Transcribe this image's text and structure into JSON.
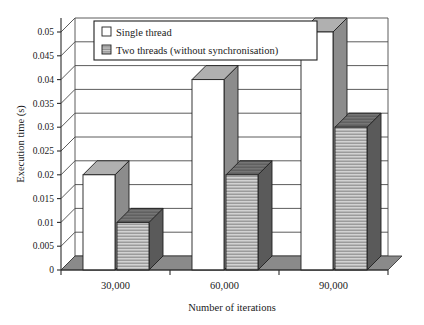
{
  "chart_data": {
    "type": "bar",
    "title": "",
    "xlabel": "Number of iterations",
    "ylabel": "Execution time (s)",
    "categories": [
      "30,000",
      "60,000",
      "90,000"
    ],
    "series": [
      {
        "name": "Single thread",
        "values": [
          0.02,
          0.04,
          0.05
        ]
      },
      {
        "name": "Two threads (without synchronisation)",
        "values": [
          0.01,
          0.02,
          0.03
        ]
      }
    ],
    "ylim": [
      0,
      0.05
    ],
    "ytick_labels": [
      "0",
      "0.005",
      "0.01",
      "0.015",
      "0.02",
      "0.025",
      "0.03",
      "0.035",
      "0.04",
      "0.045",
      "0.05"
    ],
    "ytick_values": [
      0,
      0.005,
      0.01,
      0.015,
      0.02,
      0.025,
      0.03,
      0.035,
      0.04,
      0.045,
      0.05
    ],
    "grid": true,
    "legend_position": "top-center",
    "style": "3d-columns",
    "colors": {
      "single_thread_front": "#ffffff",
      "single_thread_top": "#b0b0b0",
      "single_thread_side": "#8c8c8c",
      "two_threads_front": "#c8c8c8",
      "two_threads_hatch": "#8a8a8a",
      "two_threads_top": "#6e6e6e",
      "two_threads_side": "#5a5a5a",
      "floor": "#8a8a8a",
      "axis": "#2b2b2b",
      "gridline": "#4a4a4a"
    }
  },
  "legend": {
    "items": [
      {
        "label": "Single thread",
        "swatch": "white-square"
      },
      {
        "label": "Two threads (without synchronisation)",
        "swatch": "hatched-square"
      }
    ]
  }
}
